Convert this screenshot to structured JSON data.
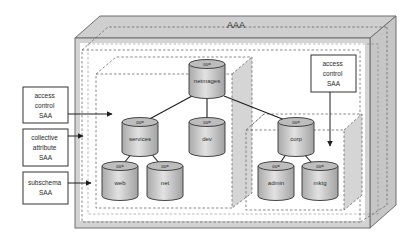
{
  "diagram": {
    "outer_label": "AAA",
    "colors": {
      "box_fill": "#d0d0d0",
      "box_stroke": "#6f6f6f",
      "dash": "#6a6a6a",
      "cylinder_fill": "#c8c8c8",
      "cylinder_top": "#b4b4b4",
      "line": "#1e1e1e",
      "text": "#2a2a2a"
    },
    "left_boxes": [
      {
        "lines": [
          "access",
          "control",
          "SAA"
        ]
      },
      {
        "lines": [
          "collective",
          "attribute",
          "SAA"
        ]
      },
      {
        "lines": [
          "subschema",
          "SAA"
        ]
      }
    ],
    "right_box": {
      "lines": [
        "access",
        "control",
        "SAA"
      ]
    },
    "nodes": [
      {
        "id": "netmages",
        "prefix": "ou=",
        "label": "netmages"
      },
      {
        "id": "services",
        "prefix": "ou=",
        "label": "services"
      },
      {
        "id": "dev",
        "prefix": "ou=",
        "label": "dev"
      },
      {
        "id": "corp",
        "prefix": "ou=",
        "label": "corp"
      },
      {
        "id": "web",
        "prefix": "ou=",
        "label": "web"
      },
      {
        "id": "net",
        "prefix": "ou=",
        "label": "net"
      },
      {
        "id": "admin",
        "prefix": "ou=",
        "label": "admin"
      },
      {
        "id": "mktg",
        "prefix": "ou=",
        "label": "mktg"
      }
    ],
    "edges": [
      [
        "netmages",
        "services"
      ],
      [
        "netmages",
        "dev"
      ],
      [
        "netmages",
        "corp"
      ],
      [
        "services",
        "web"
      ],
      [
        "services",
        "net"
      ],
      [
        "corp",
        "admin"
      ],
      [
        "corp",
        "mktg"
      ]
    ]
  }
}
